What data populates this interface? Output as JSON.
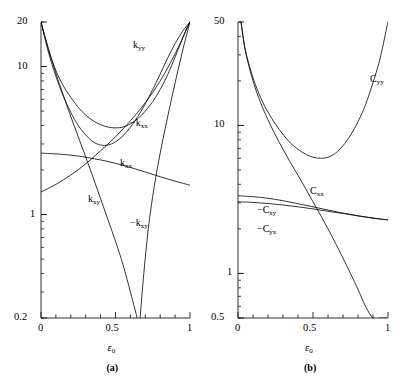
{
  "figure": {
    "panels": [
      {
        "tag": "(a)",
        "xaxis": {
          "title_sym": "ε",
          "title_sub": "0",
          "ticks": [
            "0",
            "0.5",
            "1"
          ],
          "min": 0,
          "max": 1
        },
        "yaxis": {
          "scale": "log",
          "min": 0.2,
          "max": 20,
          "ticks": [
            "20",
            "10",
            "1",
            "0.2"
          ],
          "tick_values": [
            20,
            10,
            1,
            0.2
          ]
        },
        "curve_labels": [
          {
            "text": "k",
            "sub": "yy",
            "neg": false
          },
          {
            "text": "k",
            "sub": "xx",
            "neg": true
          },
          {
            "text": "k",
            "sub": "xx",
            "neg": false
          },
          {
            "text": "k",
            "sub": "xy",
            "neg": false
          },
          {
            "text": "k",
            "sub": "xy",
            "neg": true
          }
        ]
      },
      {
        "tag": "(b)",
        "xaxis": {
          "title_sym": "ε",
          "title_sub": "0",
          "ticks": [
            "0",
            "0.5",
            "1"
          ],
          "min": 0,
          "max": 1
        },
        "yaxis": {
          "scale": "log",
          "min": 0.5,
          "max": 50,
          "ticks": [
            "50",
            "10",
            "1",
            "0.5"
          ],
          "tick_values": [
            50,
            10,
            1,
            0.5
          ]
        },
        "curve_labels": [
          {
            "text": "C",
            "sub": "yy",
            "neg": false
          },
          {
            "text": "C",
            "sub": "xx",
            "neg": false
          },
          {
            "text": "C",
            "sub": "xy",
            "neg": true
          },
          {
            "text": "C",
            "sub": "yx",
            "neg": true
          }
        ]
      }
    ]
  },
  "chart_data": [
    {
      "type": "line",
      "title": "",
      "panel": "(a)",
      "xlabel": "ε₀",
      "ylabel": "",
      "xlim": [
        0,
        1
      ],
      "ylim": [
        0.2,
        20
      ],
      "yscale": "log",
      "grid": false,
      "legend": "inline-annotations",
      "xticks": [
        0,
        0.5,
        1
      ],
      "xticklabels": [
        "0",
        "0.5",
        "1"
      ],
      "yticks": [
        0.2,
        1,
        10,
        20
      ],
      "yticklabels": [
        "0.2",
        "1",
        "10",
        "20"
      ],
      "series": [
        {
          "name": "k_yy",
          "label": "k_yy",
          "x": [
            0.0,
            0.05,
            0.1,
            0.15,
            0.2,
            0.25,
            0.3,
            0.35,
            0.4,
            0.45,
            0.5,
            0.55,
            0.6,
            0.65,
            0.7,
            0.75,
            0.8,
            0.85,
            0.9,
            0.94,
            0.97,
            0.99,
            1.0
          ],
          "values": [
            20.0,
            13.0,
            9.4,
            7.4,
            6.2,
            5.3,
            4.7,
            4.3,
            4.05,
            3.9,
            3.85,
            3.9,
            4.1,
            4.45,
            5.0,
            5.8,
            7.0,
            8.8,
            11.6,
            14.6,
            17.4,
            19.3,
            20.0
          ]
        },
        {
          "name": "k_xx_neg",
          "label": "-k_xx",
          "x": [
            0.0,
            0.05,
            0.1,
            0.15,
            0.2,
            0.25,
            0.3,
            0.35,
            0.4,
            0.45,
            0.5,
            0.55,
            0.6,
            0.65,
            0.7,
            0.75,
            0.8,
            0.85,
            0.9,
            0.95,
            1.0
          ],
          "values": [
            20.0,
            12.5,
            8.6,
            6.3,
            4.9,
            4.0,
            3.45,
            3.1,
            2.95,
            2.95,
            3.1,
            3.4,
            3.9,
            4.6,
            5.6,
            7.0,
            8.9,
            11.4,
            14.3,
            17.3,
            20.0
          ]
        },
        {
          "name": "k_xx",
          "label": "k_xx",
          "x": [
            0.0,
            0.1,
            0.2,
            0.3,
            0.4,
            0.5,
            0.6,
            0.7,
            0.8,
            0.9,
            1.0
          ],
          "values": [
            2.6,
            2.57,
            2.52,
            2.44,
            2.34,
            2.22,
            2.08,
            1.94,
            1.8,
            1.68,
            1.58
          ]
        },
        {
          "name": "k_xy",
          "label": "k_xy",
          "x": [
            0.0,
            0.05,
            0.1,
            0.15,
            0.2,
            0.25,
            0.3,
            0.35,
            0.4,
            0.45,
            0.5,
            0.55,
            0.6,
            0.63,
            0.645
          ],
          "values": [
            20.0,
            13.2,
            9.0,
            6.4,
            4.6,
            3.35,
            2.45,
            1.78,
            1.28,
            0.92,
            0.66,
            0.46,
            0.3,
            0.23,
            0.2
          ]
        },
        {
          "name": "k_xy_neg",
          "label": "-k_xy",
          "x": [
            0.665,
            0.69,
            0.72,
            0.76,
            0.8,
            0.84,
            0.88,
            0.92,
            0.96,
            1.0
          ],
          "values": [
            0.2,
            0.4,
            0.8,
            1.55,
            2.6,
            4.1,
            6.3,
            9.5,
            14.0,
            20.0
          ]
        },
        {
          "name": "k_rise_left",
          "label": "",
          "x": [
            0.0,
            0.1,
            0.2,
            0.3,
            0.4,
            0.5,
            0.6,
            0.7,
            0.8,
            0.9,
            1.0
          ],
          "values": [
            1.42,
            1.6,
            1.85,
            2.2,
            2.7,
            3.35,
            4.3,
            5.7,
            8.0,
            12.2,
            20.0
          ]
        }
      ]
    },
    {
      "type": "line",
      "title": "",
      "panel": "(b)",
      "xlabel": "ε₀",
      "ylabel": "",
      "xlim": [
        0,
        1
      ],
      "ylim": [
        0.5,
        50
      ],
      "yscale": "log",
      "grid": false,
      "legend": "inline-annotations",
      "xticks": [
        0,
        0.5,
        1
      ],
      "xticklabels": [
        "0",
        "0.5",
        "1"
      ],
      "yticks": [
        0.5,
        1,
        10,
        50
      ],
      "yticklabels": [
        "0.5",
        "1",
        "10",
        "50"
      ],
      "series": [
        {
          "name": "C_yy",
          "label": "C_yy",
          "x": [
            0.02,
            0.05,
            0.1,
            0.15,
            0.2,
            0.25,
            0.3,
            0.35,
            0.4,
            0.45,
            0.5,
            0.55,
            0.6,
            0.65,
            0.7,
            0.75,
            0.8,
            0.85,
            0.9,
            0.94,
            0.97,
            0.99,
            1.0
          ],
          "values": [
            50.0,
            32.0,
            21.0,
            15.5,
            12.3,
            10.2,
            8.7,
            7.6,
            6.9,
            6.4,
            6.1,
            6.0,
            6.1,
            6.5,
            7.3,
            8.6,
            10.6,
            13.8,
            19.5,
            26.5,
            36.0,
            45.0,
            50.0
          ]
        },
        {
          "name": "C_xx",
          "label": "C_xx",
          "x": [
            0.02,
            0.05,
            0.1,
            0.15,
            0.2,
            0.25,
            0.3,
            0.35,
            0.4,
            0.45,
            0.5,
            0.55,
            0.6,
            0.65,
            0.7,
            0.75,
            0.8,
            0.85,
            0.9,
            0.95,
            0.985
          ],
          "values": [
            50.0,
            31.5,
            20.0,
            14.3,
            10.9,
            8.6,
            6.9,
            5.6,
            4.6,
            3.75,
            3.05,
            2.48,
            2.0,
            1.6,
            1.27,
            1.0,
            0.78,
            0.6,
            0.46,
            0.34,
            0.5
          ]
        },
        {
          "name": "C_xy_neg",
          "label": "-C_xy",
          "x": [
            0.0,
            0.1,
            0.2,
            0.3,
            0.4,
            0.5,
            0.6,
            0.7,
            0.8,
            0.9,
            1.0
          ],
          "values": [
            3.35,
            3.3,
            3.22,
            3.1,
            2.96,
            2.82,
            2.68,
            2.56,
            2.45,
            2.36,
            2.3
          ]
        },
        {
          "name": "C_yx_neg",
          "label": "-C_yx",
          "x": [
            0.0,
            0.1,
            0.2,
            0.3,
            0.4,
            0.5,
            0.6,
            0.7,
            0.8,
            0.9,
            1.0
          ],
          "values": [
            3.05,
            3.02,
            2.97,
            2.9,
            2.82,
            2.73,
            2.63,
            2.54,
            2.45,
            2.37,
            2.3
          ]
        }
      ]
    }
  ]
}
